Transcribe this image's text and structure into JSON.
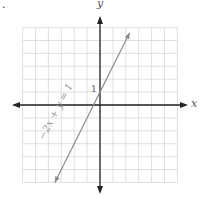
{
  "marker": ".",
  "chart_data": {
    "type": "line",
    "title": "",
    "xlabel": "x",
    "ylabel": "y",
    "xlim": [
      -6,
      6
    ],
    "ylim": [
      -6,
      6
    ],
    "grid": true,
    "series": [
      {
        "name": "−2x + y = 1",
        "equation": "y = 2x + 1",
        "x": [
          -3.5,
          2.3
        ],
        "y": [
          -6.0,
          5.6
        ],
        "color": "#8a8a8a"
      }
    ],
    "annotations": [
      {
        "text": "1",
        "x": 0,
        "y": 1
      }
    ],
    "line_label": "−2x + y = 1"
  },
  "colors": {
    "axis": "#222222",
    "grid": "#d8d8d8",
    "line": "#8a8a8a"
  }
}
